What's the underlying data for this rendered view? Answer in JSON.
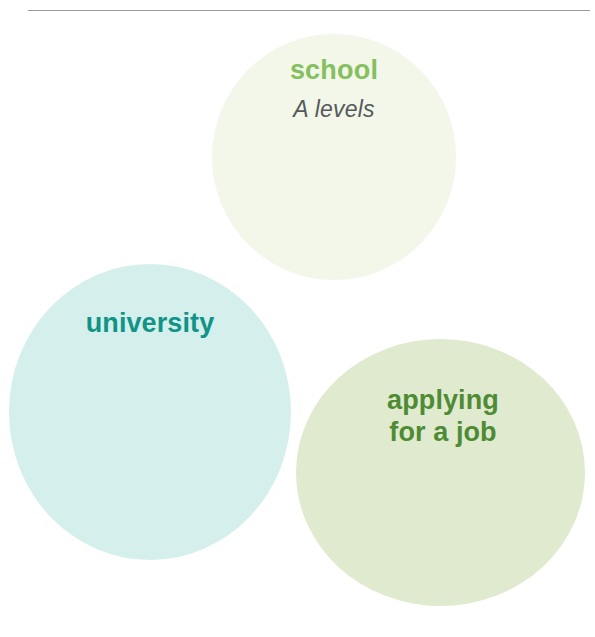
{
  "page": {
    "background_color": "#ffffff",
    "width": 595,
    "height": 637
  },
  "divider": {
    "name": "top-horizontal-rule",
    "color": "#9a9a9a"
  },
  "circles": [
    {
      "id": "school",
      "fill_color": "#f2f7ea",
      "heading": "school",
      "heading_color": "#86bf5e",
      "subheading": "A levels",
      "subheading_color": "#55595b"
    },
    {
      "id": "university",
      "fill_color": "#d4efec",
      "heading": "university",
      "heading_color": "#109487"
    },
    {
      "id": "job",
      "fill_color": "#dfeacf",
      "heading_line_1": "applying",
      "heading_line_2": "for a job",
      "heading_color": "#4e8b34"
    }
  ]
}
